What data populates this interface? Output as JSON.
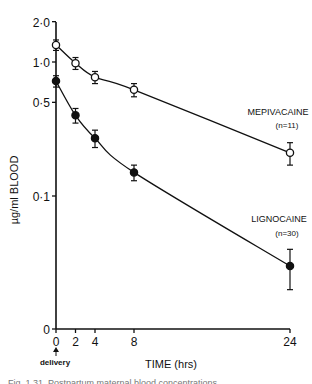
{
  "chart_data": {
    "type": "line",
    "title": "",
    "xlabel": "TIME (hrs)",
    "ylabel": "µg/ml BLOOD",
    "yscale": "log",
    "ylim": [
      0,
      2.0
    ],
    "xlim": [
      0,
      24
    ],
    "x_ticks": [
      0,
      2,
      4,
      8,
      24
    ],
    "x_tick_labels": [
      "0",
      "2",
      "4",
      "8",
      "24"
    ],
    "y_ticks": [
      0,
      0.1,
      0.5,
      1.0,
      2.0
    ],
    "y_tick_labels": [
      "0",
      "0·1",
      "0·5",
      "1·0",
      "2·0"
    ],
    "annotation": "delivery",
    "x": [
      0,
      2,
      4,
      8,
      24
    ],
    "series": [
      {
        "name": "MEPIVACAINE",
        "n_label": "(n=11)",
        "marker": "open-circle",
        "values": [
          1.34,
          0.98,
          0.77,
          0.62,
          0.21
        ],
        "err": [
          0.12,
          0.1,
          0.08,
          0.07,
          0.04
        ]
      },
      {
        "name": "LIGNOCAINE",
        "n_label": "(n=30)",
        "marker": "filled-circle",
        "values": [
          0.72,
          0.4,
          0.27,
          0.15,
          0.03
        ],
        "err": [
          0.07,
          0.05,
          0.04,
          0.02,
          0.01
        ]
      }
    ],
    "grid": false,
    "legend": "inline labels at right of each curve"
  },
  "caption_fragment": "Fig. 1.31. Postpartum maternal blood concentrations..."
}
